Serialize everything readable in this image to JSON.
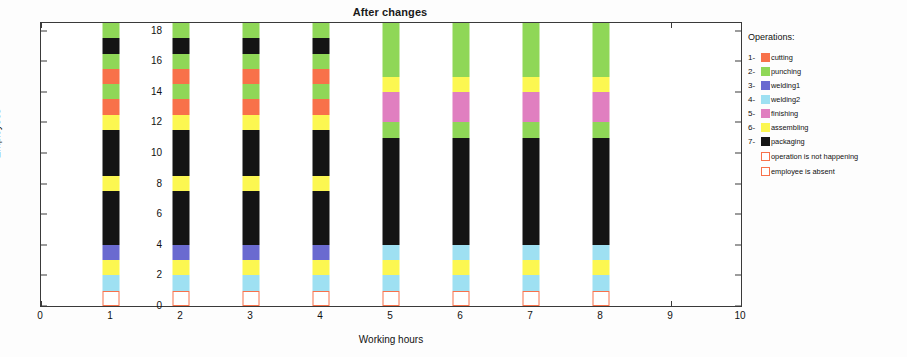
{
  "chart_data": {
    "type": "bar",
    "subtype": "stacked-vertical",
    "title": "After changes",
    "xlabel": "Working hours",
    "ylabel": "Employees",
    "xlim": [
      0,
      10
    ],
    "ylim": [
      0,
      18.5
    ],
    "x_ticks": [
      0,
      1,
      2,
      3,
      4,
      5,
      6,
      7,
      8,
      9,
      10
    ],
    "y_ticks": [
      0,
      2,
      4,
      6,
      8,
      10,
      12,
      14,
      16,
      18
    ],
    "grid": false,
    "legend_position": "right-outside",
    "categories": [
      "1",
      "2",
      "3",
      "4",
      "5",
      "6",
      "7",
      "8"
    ],
    "operations": [
      {
        "num": "1-",
        "name": "cutting",
        "color": "#f8714a"
      },
      {
        "num": "2-",
        "name": "punching",
        "color": "#8fd757"
      },
      {
        "num": "3-",
        "name": "welding1",
        "color": "#6a6ad0"
      },
      {
        "num": "4-",
        "name": "welding2",
        "color": "#9ee0f2"
      },
      {
        "num": "5-",
        "name": "finishing",
        "color": "#e07fc0"
      },
      {
        "num": "6-",
        "name": "assembling",
        "color": "#fcf751"
      },
      {
        "num": "7-",
        "name": "packaging",
        "color": "#141414"
      }
    ],
    "notes": [
      {
        "name": "operation is not happening",
        "color": "#ffffff",
        "border": "#f8714a"
      },
      {
        "name": "employee is absent",
        "color": "#ffffff",
        "border": "#f8714a"
      }
    ],
    "bars": [
      {
        "x": 1,
        "total": 18.5,
        "segments": [
          {
            "op": "not-happening",
            "from": 0.0,
            "to": 1.0
          },
          {
            "op": "welding2",
            "from": 1.0,
            "to": 2.0
          },
          {
            "op": "assembling",
            "from": 2.0,
            "to": 3.0
          },
          {
            "op": "welding1",
            "from": 3.0,
            "to": 4.0
          },
          {
            "op": "packaging",
            "from": 4.0,
            "to": 7.5
          },
          {
            "op": "assembling",
            "from": 7.5,
            "to": 8.5
          },
          {
            "op": "packaging",
            "from": 8.5,
            "to": 11.5
          },
          {
            "op": "assembling",
            "from": 11.5,
            "to": 12.5
          },
          {
            "op": "cutting",
            "from": 12.5,
            "to": 13.5
          },
          {
            "op": "punching",
            "from": 13.5,
            "to": 14.5
          },
          {
            "op": "cutting",
            "from": 14.5,
            "to": 15.5
          },
          {
            "op": "punching",
            "from": 15.5,
            "to": 16.5
          },
          {
            "op": "packaging",
            "from": 16.5,
            "to": 17.5
          },
          {
            "op": "punching",
            "from": 17.5,
            "to": 18.5
          }
        ]
      },
      {
        "x": 2,
        "total": 18.5,
        "segments": [
          {
            "op": "not-happening",
            "from": 0.0,
            "to": 1.0
          },
          {
            "op": "welding2",
            "from": 1.0,
            "to": 2.0
          },
          {
            "op": "assembling",
            "from": 2.0,
            "to": 3.0
          },
          {
            "op": "welding1",
            "from": 3.0,
            "to": 4.0
          },
          {
            "op": "packaging",
            "from": 4.0,
            "to": 7.5
          },
          {
            "op": "assembling",
            "from": 7.5,
            "to": 8.5
          },
          {
            "op": "packaging",
            "from": 8.5,
            "to": 11.5
          },
          {
            "op": "assembling",
            "from": 11.5,
            "to": 12.5
          },
          {
            "op": "cutting",
            "from": 12.5,
            "to": 13.5
          },
          {
            "op": "punching",
            "from": 13.5,
            "to": 14.5
          },
          {
            "op": "cutting",
            "from": 14.5,
            "to": 15.5
          },
          {
            "op": "punching",
            "from": 15.5,
            "to": 16.5
          },
          {
            "op": "packaging",
            "from": 16.5,
            "to": 17.5
          },
          {
            "op": "punching",
            "from": 17.5,
            "to": 18.5
          }
        ]
      },
      {
        "x": 3,
        "total": 18.5,
        "segments": [
          {
            "op": "not-happening",
            "from": 0.0,
            "to": 1.0
          },
          {
            "op": "welding2",
            "from": 1.0,
            "to": 2.0
          },
          {
            "op": "assembling",
            "from": 2.0,
            "to": 3.0
          },
          {
            "op": "welding1",
            "from": 3.0,
            "to": 4.0
          },
          {
            "op": "packaging",
            "from": 4.0,
            "to": 7.5
          },
          {
            "op": "assembling",
            "from": 7.5,
            "to": 8.5
          },
          {
            "op": "packaging",
            "from": 8.5,
            "to": 11.5
          },
          {
            "op": "assembling",
            "from": 11.5,
            "to": 12.5
          },
          {
            "op": "cutting",
            "from": 12.5,
            "to": 13.5
          },
          {
            "op": "punching",
            "from": 13.5,
            "to": 14.5
          },
          {
            "op": "cutting",
            "from": 14.5,
            "to": 15.5
          },
          {
            "op": "punching",
            "from": 15.5,
            "to": 16.5
          },
          {
            "op": "packaging",
            "from": 16.5,
            "to": 17.5
          },
          {
            "op": "punching",
            "from": 17.5,
            "to": 18.5
          }
        ]
      },
      {
        "x": 4,
        "total": 18.5,
        "segments": [
          {
            "op": "not-happening",
            "from": 0.0,
            "to": 1.0
          },
          {
            "op": "welding2",
            "from": 1.0,
            "to": 2.0
          },
          {
            "op": "assembling",
            "from": 2.0,
            "to": 3.0
          },
          {
            "op": "welding1",
            "from": 3.0,
            "to": 4.0
          },
          {
            "op": "packaging",
            "from": 4.0,
            "to": 7.5
          },
          {
            "op": "assembling",
            "from": 7.5,
            "to": 8.5
          },
          {
            "op": "packaging",
            "from": 8.5,
            "to": 11.5
          },
          {
            "op": "assembling",
            "from": 11.5,
            "to": 12.5
          },
          {
            "op": "cutting",
            "from": 12.5,
            "to": 13.5
          },
          {
            "op": "punching",
            "from": 13.5,
            "to": 14.5
          },
          {
            "op": "cutting",
            "from": 14.5,
            "to": 15.5
          },
          {
            "op": "punching",
            "from": 15.5,
            "to": 16.5
          },
          {
            "op": "packaging",
            "from": 16.5,
            "to": 17.5
          },
          {
            "op": "punching",
            "from": 17.5,
            "to": 18.5
          }
        ]
      },
      {
        "x": 5,
        "total": 18.5,
        "segments": [
          {
            "op": "not-happening",
            "from": 0.0,
            "to": 1.0
          },
          {
            "op": "welding2",
            "from": 1.0,
            "to": 2.0
          },
          {
            "op": "assembling",
            "from": 2.0,
            "to": 3.0
          },
          {
            "op": "welding2",
            "from": 3.0,
            "to": 4.0
          },
          {
            "op": "packaging",
            "from": 4.0,
            "to": 11.0
          },
          {
            "op": "punching",
            "from": 11.0,
            "to": 12.0
          },
          {
            "op": "finishing",
            "from": 12.0,
            "to": 14.0
          },
          {
            "op": "assembling",
            "from": 14.0,
            "to": 15.0
          },
          {
            "op": "punching",
            "from": 15.0,
            "to": 18.5
          }
        ]
      },
      {
        "x": 6,
        "total": 18.5,
        "segments": [
          {
            "op": "not-happening",
            "from": 0.0,
            "to": 1.0
          },
          {
            "op": "welding2",
            "from": 1.0,
            "to": 2.0
          },
          {
            "op": "assembling",
            "from": 2.0,
            "to": 3.0
          },
          {
            "op": "welding2",
            "from": 3.0,
            "to": 4.0
          },
          {
            "op": "packaging",
            "from": 4.0,
            "to": 11.0
          },
          {
            "op": "punching",
            "from": 11.0,
            "to": 12.0
          },
          {
            "op": "finishing",
            "from": 12.0,
            "to": 14.0
          },
          {
            "op": "assembling",
            "from": 14.0,
            "to": 15.0
          },
          {
            "op": "punching",
            "from": 15.0,
            "to": 18.5
          }
        ]
      },
      {
        "x": 7,
        "total": 18.5,
        "segments": [
          {
            "op": "not-happening",
            "from": 0.0,
            "to": 1.0
          },
          {
            "op": "welding2",
            "from": 1.0,
            "to": 2.0
          },
          {
            "op": "assembling",
            "from": 2.0,
            "to": 3.0
          },
          {
            "op": "welding2",
            "from": 3.0,
            "to": 4.0
          },
          {
            "op": "packaging",
            "from": 4.0,
            "to": 11.0
          },
          {
            "op": "punching",
            "from": 11.0,
            "to": 12.0
          },
          {
            "op": "finishing",
            "from": 12.0,
            "to": 14.0
          },
          {
            "op": "assembling",
            "from": 14.0,
            "to": 15.0
          },
          {
            "op": "punching",
            "from": 15.0,
            "to": 18.5
          }
        ]
      },
      {
        "x": 8,
        "total": 18.5,
        "segments": [
          {
            "op": "not-happening",
            "from": 0.0,
            "to": 1.0
          },
          {
            "op": "welding2",
            "from": 1.0,
            "to": 2.0
          },
          {
            "op": "assembling",
            "from": 2.0,
            "to": 3.0
          },
          {
            "op": "welding2",
            "from": 3.0,
            "to": 4.0
          },
          {
            "op": "packaging",
            "from": 4.0,
            "to": 11.0
          },
          {
            "op": "punching",
            "from": 11.0,
            "to": 12.0
          },
          {
            "op": "finishing",
            "from": 12.0,
            "to": 14.0
          },
          {
            "op": "assembling",
            "from": 14.0,
            "to": 15.0
          },
          {
            "op": "punching",
            "from": 15.0,
            "to": 18.5
          }
        ]
      }
    ]
  },
  "legend": {
    "title": "Operations:"
  }
}
